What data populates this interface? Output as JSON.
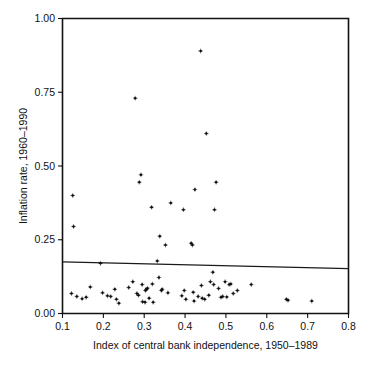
{
  "figure": {
    "background_color": "#ffffff",
    "ink_color": "#111111"
  },
  "chart_data": {
    "type": "scatter",
    "title": "",
    "subtitle": "",
    "xlabel": "Index of central bank independence, 1950–1989",
    "ylabel": "Inflation rate, 1960–1990",
    "xlim": [
      0.1,
      0.8
    ],
    "ylim": [
      0.0,
      1.0
    ],
    "xticks": [
      0.1,
      0.2,
      0.3,
      0.4,
      0.5,
      0.6,
      0.7,
      0.8
    ],
    "xtick_labels": [
      "0.1",
      "0.2",
      "0.3",
      "0.4",
      "0.5",
      "0.6",
      "0.7",
      "0.8"
    ],
    "yticks": [
      0.0,
      0.25,
      0.5,
      0.75,
      1.0
    ],
    "ytick_labels": [
      "0.00",
      "0.25",
      "0.50",
      "0.75",
      "1.00"
    ],
    "grid": false,
    "legend": null,
    "legend_position": "none",
    "marker": "plus-dot",
    "marker_color": "#0d0d0d",
    "series": [
      {
        "name": "countries",
        "points": [
          [
            0.125,
            0.4
          ],
          [
            0.127,
            0.295
          ],
          [
            0.122,
            0.068
          ],
          [
            0.135,
            0.058
          ],
          [
            0.148,
            0.05
          ],
          [
            0.158,
            0.055
          ],
          [
            0.168,
            0.09
          ],
          [
            0.193,
            0.17
          ],
          [
            0.198,
            0.07
          ],
          [
            0.21,
            0.06
          ],
          [
            0.218,
            0.058
          ],
          [
            0.228,
            0.082
          ],
          [
            0.232,
            0.048
          ],
          [
            0.238,
            0.035
          ],
          [
            0.262,
            0.088
          ],
          [
            0.272,
            0.108
          ],
          [
            0.278,
            0.73
          ],
          [
            0.282,
            0.068
          ],
          [
            0.286,
            0.062
          ],
          [
            0.288,
            0.445
          ],
          [
            0.292,
            0.47
          ],
          [
            0.295,
            0.098
          ],
          [
            0.296,
            0.04
          ],
          [
            0.302,
            0.038
          ],
          [
            0.303,
            0.078
          ],
          [
            0.305,
            0.082
          ],
          [
            0.308,
            0.086
          ],
          [
            0.312,
            0.052
          ],
          [
            0.318,
            0.36
          ],
          [
            0.32,
            0.1
          ],
          [
            0.322,
            0.038
          ],
          [
            0.332,
            0.178
          ],
          [
            0.336,
            0.122
          ],
          [
            0.338,
            0.262
          ],
          [
            0.342,
            0.078
          ],
          [
            0.344,
            0.082
          ],
          [
            0.352,
            0.232
          ],
          [
            0.358,
            0.07
          ],
          [
            0.365,
            0.375
          ],
          [
            0.392,
            0.06
          ],
          [
            0.396,
            0.352
          ],
          [
            0.398,
            0.078
          ],
          [
            0.402,
            0.048
          ],
          [
            0.415,
            0.238
          ],
          [
            0.418,
            0.232
          ],
          [
            0.42,
            0.072
          ],
          [
            0.422,
            0.042
          ],
          [
            0.424,
            0.42
          ],
          [
            0.432,
            0.058
          ],
          [
            0.438,
            0.89
          ],
          [
            0.44,
            0.095
          ],
          [
            0.442,
            0.052
          ],
          [
            0.448,
            0.048
          ],
          [
            0.452,
            0.61
          ],
          [
            0.458,
            0.062
          ],
          [
            0.462,
            0.108
          ],
          [
            0.468,
            0.14
          ],
          [
            0.47,
            0.098
          ],
          [
            0.472,
            0.352
          ],
          [
            0.476,
            0.445
          ],
          [
            0.482,
            0.085
          ],
          [
            0.488,
            0.055
          ],
          [
            0.492,
            0.058
          ],
          [
            0.498,
            0.108
          ],
          [
            0.502,
            0.056
          ],
          [
            0.508,
            0.098
          ],
          [
            0.512,
            0.1
          ],
          [
            0.518,
            0.068
          ],
          [
            0.528,
            0.078
          ],
          [
            0.562,
            0.098
          ],
          [
            0.648,
            0.048
          ],
          [
            0.652,
            0.045
          ],
          [
            0.71,
            0.042
          ]
        ]
      }
    ],
    "reference_line": {
      "name": "fitted-line",
      "x_start": 0.1,
      "y_start": 0.175,
      "x_end": 0.8,
      "y_end": 0.152
    }
  }
}
